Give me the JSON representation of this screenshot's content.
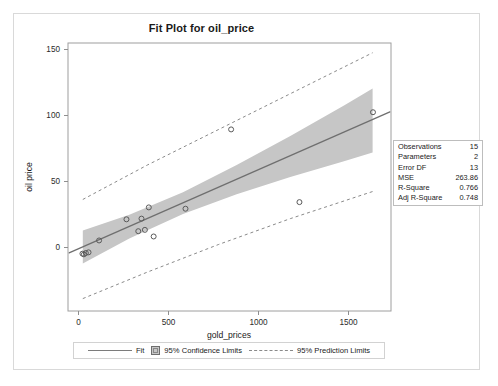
{
  "plot": {
    "title": "Fit Plot for oil_price",
    "xlabel": "gold_prices",
    "ylabel": "oil price"
  },
  "axes": {
    "x_ticks": [
      "0",
      "500",
      "1000",
      "1500"
    ],
    "y_ticks": [
      "0",
      "50",
      "100",
      "150"
    ]
  },
  "legend": {
    "fit_label": "Fit",
    "confidence_label": "95% Confidence Limits",
    "prediction_label": "95% Prediction Limits"
  },
  "stats": {
    "rows": [
      {
        "label": "Observations",
        "value": "15"
      },
      {
        "label": "Parameters",
        "value": "2"
      },
      {
        "label": "Error DF",
        "value": "13"
      },
      {
        "label": "MSE",
        "value": "263.86"
      },
      {
        "label": "R-Square",
        "value": "0.766"
      },
      {
        "label": "Adj R-Square",
        "value": "0.748"
      }
    ]
  },
  "colors": {
    "fit_line": "#7c7c7c",
    "confidence_band": "#c6c6c6",
    "prediction_line": "#8a8a8a",
    "marker_stroke": "#5a5a5a",
    "frame": "#9e9e9e"
  },
  "chart_data": {
    "type": "scatter",
    "title": "Fit Plot for oil_price",
    "xlabel": "gold_prices",
    "ylabel": "oil price",
    "xlim": [
      -40,
      1760
    ],
    "ylim": [
      -42,
      160
    ],
    "x_ticks": [
      0,
      500,
      1000,
      1500
    ],
    "y_ticks": [
      0,
      50,
      100,
      150
    ],
    "grid": false,
    "legend_position": "bottom",
    "points": [
      {
        "x": 38,
        "y": 1
      },
      {
        "x": 57,
        "y": 1.5
      },
      {
        "x": 72,
        "y": 2
      },
      {
        "x": 131,
        "y": 11
      },
      {
        "x": 284,
        "y": 27
      },
      {
        "x": 350,
        "y": 18
      },
      {
        "x": 368,
        "y": 27.5
      },
      {
        "x": 387,
        "y": 19
      },
      {
        "x": 409,
        "y": 36
      },
      {
        "x": 436,
        "y": 14
      },
      {
        "x": 614,
        "y": 35
      },
      {
        "x": 869,
        "y": 95
      },
      {
        "x": 1251,
        "y": 40
      },
      {
        "x": 1662,
        "y": 108
      },
      {
        "x": 46,
        "y": 0.5
      }
    ],
    "fit_line": {
      "intercept": 3.8,
      "slope": 0.0595
    },
    "confidence_limits": {
      "description": "95% mean confidence band around the fit line, narrowest near mean x",
      "x": [
        40,
        300,
        600,
        900,
        1200,
        1500,
        1660
      ],
      "lower": [
        -6.5,
        12.5,
        31.0,
        46.0,
        59.0,
        71.0,
        77.5
      ],
      "upper": [
        18.5,
        30.5,
        47.5,
        68.0,
        90.0,
        113.0,
        126.0
      ]
    },
    "prediction_limits": {
      "description": "95% individual prediction band (dashed)",
      "x": [
        40,
        400,
        800,
        1200,
        1660
      ],
      "lower": [
        -33.0,
        -13.0,
        8.0,
        27.5,
        48.0
      ],
      "upper": [
        42.0,
        68.0,
        95.0,
        122.0,
        153.0
      ]
    },
    "statistics": {
      "Observations": 15,
      "Parameters": 2,
      "Error DF": 13,
      "MSE": 263.86,
      "R-Square": 0.766,
      "Adj R-Square": 0.748
    }
  }
}
